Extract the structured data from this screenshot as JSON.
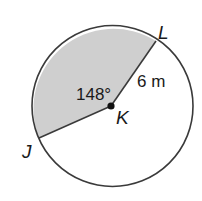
{
  "diagram": {
    "type": "circle-sector",
    "center_label": "K",
    "point_labels": {
      "L": "L",
      "J": "J"
    },
    "angle_label": "148°",
    "radius_label": "6 m",
    "colors": {
      "shaded": "#cfcfcf",
      "stroke": "#3a3a3a",
      "text": "#1a1a1a"
    }
  }
}
